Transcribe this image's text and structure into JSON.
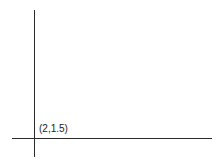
{
  "diagram": {
    "type": "coordinate-axes",
    "origin_label": "(2,1.5)",
    "colors": {
      "axis": "#2b2b2b",
      "label": "#222222",
      "background": "#ffffff"
    }
  },
  "chart_data": {
    "type": "scatter",
    "points": [
      {
        "x": 2,
        "y": 1.5,
        "label": "(2,1.5)"
      }
    ],
    "title": "",
    "xlabel": "",
    "ylabel": "",
    "grid": false
  }
}
